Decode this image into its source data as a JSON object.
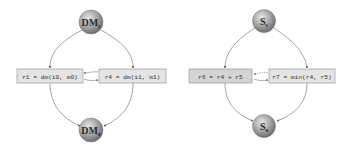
{
  "colors": {
    "node_fill_light": "#d9d9d9",
    "node_fill_dark": "#7a7a7a",
    "box_fill": "#e4e4e4",
    "box_fill_shaded": "#d4d4d4",
    "box_stroke": "#8a8a8a",
    "edge": "#666666"
  },
  "diagrams": [
    {
      "name": "dm-graph",
      "top_node": {
        "main": "DM",
        "sub": "s"
      },
      "bottom_node": {
        "main": "DM",
        "sub": "e"
      },
      "left_box": {
        "text": "r1 = dm(i0, m0)"
      },
      "right_box": {
        "text": "r4 = dm(i1, m1)"
      }
    },
    {
      "name": "s-graph",
      "top_node": {
        "main": "S",
        "sub": "s"
      },
      "bottom_node": {
        "main": "S",
        "sub": "e"
      },
      "left_box": {
        "text": "r6 = r4 + r5"
      },
      "right_box": {
        "text": "r7 = min(r4, r5)"
      }
    }
  ]
}
